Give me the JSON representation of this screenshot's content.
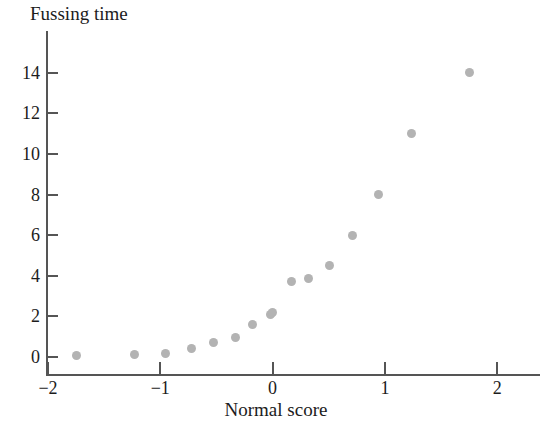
{
  "chart_data": {
    "type": "scatter",
    "title": "",
    "xlabel": "Normal score",
    "ylabel": "Fussing time",
    "xlim": [
      -2.18,
      2.22
    ],
    "ylim": [
      -0.35,
      15.4
    ],
    "grid": false,
    "legend": null,
    "marker_color": "#b3b3b3",
    "axis_color": "#555555",
    "text_color": "#1c1c1c",
    "xticks": [
      "-2",
      "-1",
      "0",
      "1",
      "2"
    ],
    "xtick_values": [
      -2,
      -1,
      0,
      1,
      2
    ],
    "yticks": [
      "0",
      "2",
      "4",
      "6",
      "8",
      "10",
      "12",
      "14"
    ],
    "ytick_values": [
      0,
      2,
      4,
      6,
      8,
      10,
      12,
      14
    ],
    "points": [
      {
        "x": -1.75,
        "y": 0.05
      },
      {
        "x": -1.23,
        "y": 0.1
      },
      {
        "x": -0.95,
        "y": 0.15
      },
      {
        "x": -0.72,
        "y": 0.4
      },
      {
        "x": -0.53,
        "y": 0.7
      },
      {
        "x": -0.33,
        "y": 0.95
      },
      {
        "x": -0.18,
        "y": 1.6
      },
      {
        "x": -0.02,
        "y": 2.1
      },
      {
        "x": 0.0,
        "y": 2.2
      },
      {
        "x": 0.17,
        "y": 3.7
      },
      {
        "x": 0.32,
        "y": 3.85
      },
      {
        "x": 0.51,
        "y": 4.5
      },
      {
        "x": 0.71,
        "y": 6.0
      },
      {
        "x": 0.94,
        "y": 8.0
      },
      {
        "x": 1.24,
        "y": 11.0
      },
      {
        "x": 1.75,
        "y": 14.0
      }
    ]
  }
}
